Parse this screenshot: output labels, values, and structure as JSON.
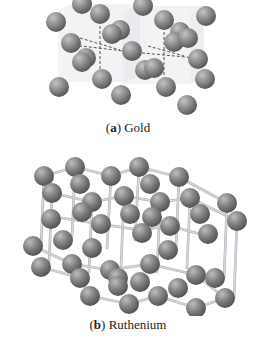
{
  "figures": [
    {
      "id": "a",
      "label": "(a)",
      "label_letter": "a",
      "name": "Gold",
      "structure": "face-centered cubic lattice, dashed bond lines, translucent unit cubes",
      "colors": {
        "sphere": "#8a8a8a",
        "sphere_highlight": "#c4c4c4",
        "sphere_shadow": "#5a5a5a",
        "cube": "#e8eaec",
        "dash": "#444444"
      },
      "cubes": [
        {
          "x": 58,
          "y": 10,
          "w": 68,
          "h": 72,
          "dx": 14,
          "dy": -6
        },
        {
          "x": 122,
          "y": 12,
          "w": 68,
          "h": 72,
          "dx": 14,
          "dy": -6
        }
      ],
      "dashes": [
        [
          64,
          44,
          132,
          52
        ],
        [
          132,
          52,
          196,
          58
        ],
        [
          100,
          16,
          100,
          80
        ],
        [
          164,
          22,
          164,
          86
        ],
        [
          80,
          38,
          120,
          50
        ],
        [
          148,
          46,
          184,
          56
        ]
      ],
      "spheres": [
        [
          82,
          4
        ],
        [
          143,
          6
        ],
        [
          56,
          22
        ],
        [
          100,
          14
        ],
        [
          164,
          20
        ],
        [
          206,
          16
        ],
        [
          120,
          30
        ],
        [
          180,
          32
        ],
        [
          112,
          34
        ],
        [
          71,
          43
        ],
        [
          174,
          42
        ],
        [
          188,
          38
        ],
        [
          132,
          51
        ],
        [
          86,
          58
        ],
        [
          82,
          62
        ],
        [
          198,
          59
        ],
        [
          145,
          70
        ],
        [
          154,
          68
        ],
        [
          102,
          79
        ],
        [
          166,
          87
        ],
        [
          205,
          79
        ],
        [
          59,
          87
        ],
        [
          121,
          95
        ],
        [
          187,
          105
        ]
      ],
      "sphere_r": 10
    },
    {
      "id": "b",
      "label": "(b)",
      "label_letter": "b",
      "name": "Ruthenium",
      "structure": "cubic-style lattice with solid rod connectors",
      "colors": {
        "sphere": "#7f7f7f",
        "sphere_highlight": "#bdbdbd",
        "sphere_shadow": "#555555",
        "rod": "#d4d8dc"
      },
      "rods": [
        [
          44,
          38,
          75,
          29
        ],
        [
          75,
          29,
          111,
          38
        ],
        [
          111,
          38,
          139,
          29
        ],
        [
          139,
          29,
          179,
          39
        ],
        [
          179,
          39,
          227,
          65
        ],
        [
          52,
          55,
          92,
          64
        ],
        [
          92,
          64,
          124,
          58
        ],
        [
          124,
          58,
          160,
          64
        ],
        [
          160,
          64,
          190,
          60
        ],
        [
          190,
          60,
          237,
          83
        ],
        [
          44,
          38,
          41,
          108
        ],
        [
          75,
          29,
          72,
          100
        ],
        [
          111,
          38,
          107,
          110
        ],
        [
          139,
          29,
          135,
          102
        ],
        [
          179,
          39,
          176,
          110
        ],
        [
          227,
          65,
          224,
          140
        ],
        [
          52,
          55,
          49,
          125
        ],
        [
          92,
          64,
          89,
          134
        ],
        [
          124,
          58,
          121,
          128
        ],
        [
          160,
          64,
          157,
          134
        ],
        [
          190,
          60,
          187,
          130
        ],
        [
          237,
          83,
          234,
          160
        ],
        [
          33,
          108,
          72,
          126
        ],
        [
          72,
          126,
          110,
          132
        ],
        [
          110,
          132,
          150,
          126
        ],
        [
          150,
          126,
          196,
          137
        ],
        [
          196,
          137,
          225,
          160
        ],
        [
          41,
          129,
          80,
          140
        ],
        [
          80,
          140,
          90,
          158
        ],
        [
          90,
          158,
          129,
          166
        ],
        [
          129,
          166,
          158,
          158
        ],
        [
          158,
          158,
          196,
          170
        ],
        [
          196,
          170,
          225,
          160
        ],
        [
          62,
          80,
          100,
          86
        ],
        [
          100,
          86,
          140,
          92
        ],
        [
          140,
          92,
          170,
          88
        ],
        [
          170,
          88,
          200,
          96
        ]
      ],
      "spheres": [
        [
          44,
          38
        ],
        [
          75,
          29
        ],
        [
          111,
          38
        ],
        [
          139,
          29
        ],
        [
          179,
          39
        ],
        [
          227,
          65
        ],
        [
          80,
          46
        ],
        [
          150,
          46
        ],
        [
          52,
          55
        ],
        [
          92,
          64
        ],
        [
          124,
          58
        ],
        [
          160,
          64
        ],
        [
          190,
          60
        ],
        [
          51,
          81
        ],
        [
          82,
          74
        ],
        [
          101,
          86
        ],
        [
          130,
          76
        ],
        [
          152,
          79
        ],
        [
          170,
          88
        ],
        [
          200,
          76
        ],
        [
          237,
          83
        ],
        [
          63,
          102
        ],
        [
          92,
          110
        ],
        [
          142,
          95
        ],
        [
          168,
          112
        ],
        [
          208,
          96
        ],
        [
          33,
          108
        ],
        [
          72,
          126
        ],
        [
          110,
          132
        ],
        [
          150,
          126
        ],
        [
          196,
          137
        ],
        [
          225,
          160
        ],
        [
          41,
          129
        ],
        [
          80,
          140
        ],
        [
          118,
          140
        ],
        [
          140,
          144
        ],
        [
          178,
          150
        ],
        [
          215,
          140
        ],
        [
          90,
          158
        ],
        [
          129,
          166
        ],
        [
          158,
          158
        ],
        [
          196,
          170
        ],
        [
          118,
          148
        ]
      ],
      "sphere_r": 10
    }
  ]
}
